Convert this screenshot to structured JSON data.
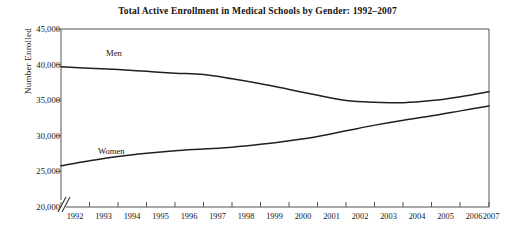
{
  "chart_data": {
    "type": "line",
    "title": "Total Active Enrollment in Medical Schools by Gender: 1992–2007",
    "xlabel": "",
    "ylabel": "Number Enrolled",
    "categories": [
      "1992",
      "1993",
      "1994",
      "1995",
      "1996",
      "1997",
      "1998",
      "1999",
      "2000",
      "2001",
      "2002",
      "2003",
      "2004",
      "2005",
      "2006",
      "2007"
    ],
    "x": [
      1992,
      1993,
      1994,
      1995,
      1996,
      1997,
      1998,
      1999,
      2000,
      2001,
      2002,
      2003,
      2004,
      2005,
      2006,
      2007
    ],
    "series": [
      {
        "name": "Men",
        "values": [
          39700,
          39500,
          39300,
          39050,
          38800,
          38600,
          38000,
          37300,
          36500,
          35700,
          34950,
          34700,
          34650,
          34950,
          35500,
          36200
        ]
      },
      {
        "name": "Women",
        "values": [
          25800,
          26500,
          27100,
          27550,
          27900,
          28150,
          28400,
          28800,
          29300,
          29900,
          30700,
          31500,
          32200,
          32800,
          33500,
          34200
        ]
      }
    ],
    "ylim": [
      20000,
      45000
    ],
    "yticks": [
      20000,
      25000,
      30000,
      35000,
      40000,
      45000
    ],
    "ytick_labels": [
      "20,000",
      "25,000",
      "30,000",
      "35,000",
      "40,000",
      "45,000"
    ],
    "xlim": [
      1992,
      2007
    ],
    "grid": false,
    "legend_position": "inline-annotations",
    "axis_break": true,
    "annotations": [
      {
        "text": "Men",
        "series": "Men",
        "near_x": 1993
      },
      {
        "text": "Women",
        "series": "Women",
        "near_x": 1993
      }
    ],
    "colors": {
      "line": "#202020",
      "axis": "#555555",
      "text": "#141414",
      "background": "#ffffff"
    }
  }
}
